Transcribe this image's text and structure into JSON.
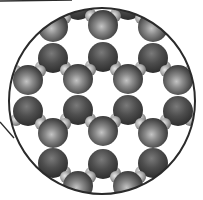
{
  "figure": {
    "colors": {
      "background": "#ffffff",
      "outline": "#2a2a2a",
      "large_sphere_dark": "#3c3c3c",
      "large_sphere_mid": "#6e6e6e",
      "large_sphere_highlight": "#b5b5b5",
      "small_sphere": "#a8a8a8",
      "small_sphere_highlight": "#e0e0e0"
    },
    "inset_circle": {
      "cx": 102,
      "cy": 101,
      "r": 93
    },
    "pointer_lines": [
      {
        "x1": 0,
        "y1": 1,
        "x2": 72,
        "y2": 0
      },
      {
        "x1": 0,
        "y1": 122,
        "x2": 14,
        "y2": 138
      }
    ],
    "up_molecules": [
      [
        53,
        27
      ],
      [
        103,
        25
      ],
      [
        153,
        27
      ],
      [
        28,
        80
      ],
      [
        78,
        79
      ],
      [
        128,
        79
      ],
      [
        178,
        80
      ],
      [
        53,
        133
      ],
      [
        103,
        131
      ],
      [
        153,
        133
      ],
      [
        78,
        186
      ],
      [
        128,
        186
      ]
    ],
    "down_molecules": [
      [
        78,
        5
      ],
      [
        128,
        5
      ],
      [
        53,
        58
      ],
      [
        103,
        57
      ],
      [
        153,
        58
      ],
      [
        28,
        111
      ],
      [
        78,
        110
      ],
      [
        128,
        110
      ],
      [
        178,
        111
      ],
      [
        53,
        163
      ],
      [
        103,
        164
      ],
      [
        153,
        163
      ]
    ],
    "large_radius": 15,
    "small_radius": 6
  }
}
